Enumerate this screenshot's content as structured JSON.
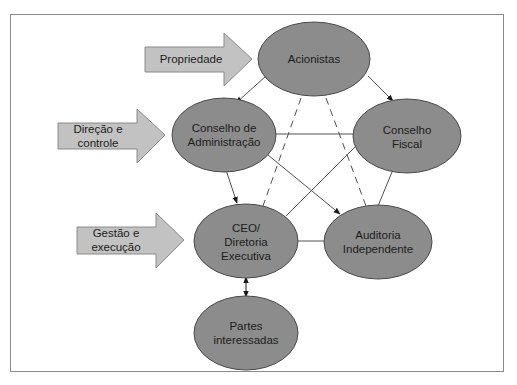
{
  "diagram": {
    "colors": {
      "node_fill": "#8c8c8c",
      "node_stroke": "#4a4a4a",
      "arrow_fill": "#c2c2c2",
      "arrow_stroke": "#8a8a8a",
      "line": "#505050",
      "frame": "#8a8a8a"
    },
    "nodes": {
      "acionistas": {
        "lines": [
          "Acionistas"
        ]
      },
      "conselho_admin": {
        "lines": [
          "Conselho de",
          "Administração"
        ]
      },
      "conselho_fiscal": {
        "lines": [
          "Conselho",
          "Fiscal"
        ]
      },
      "ceo": {
        "lines": [
          "CEO/",
          "Diretoria",
          "Executiva"
        ]
      },
      "auditoria": {
        "lines": [
          "Auditoria",
          "Independente"
        ]
      },
      "partes": {
        "lines": [
          "Partes",
          "interessadas"
        ]
      }
    },
    "side_arrows": {
      "propriedade": {
        "lines": [
          "Propriedade"
        ]
      },
      "direcao": {
        "lines": [
          "Direção e",
          "controle"
        ]
      },
      "gestao": {
        "lines": [
          "Gestão e",
          "execução"
        ]
      }
    },
    "connections": [
      {
        "from": "Acionistas",
        "to": "Conselho de Administração",
        "style": "solid-arrow"
      },
      {
        "from": "Acionistas",
        "to": "Conselho Fiscal",
        "style": "solid-arrow"
      },
      {
        "from": "Acionistas",
        "to": "CEO/Diretoria Executiva",
        "style": "dashed"
      },
      {
        "from": "Acionistas",
        "to": "Auditoria Independente",
        "style": "dashed"
      },
      {
        "from": "Conselho de Administração",
        "to": "Conselho Fiscal",
        "style": "solid"
      },
      {
        "from": "Conselho de Administração",
        "to": "CEO/Diretoria Executiva",
        "style": "solid-arrow"
      },
      {
        "from": "Conselho de Administração",
        "to": "Auditoria Independente",
        "style": "solid-arrow"
      },
      {
        "from": "Conselho Fiscal",
        "to": "CEO/Diretoria Executiva",
        "style": "solid"
      },
      {
        "from": "Conselho Fiscal",
        "to": "Auditoria Independente",
        "style": "solid"
      },
      {
        "from": "CEO/Diretoria Executiva",
        "to": "Auditoria Independente",
        "style": "solid"
      },
      {
        "from": "CEO/Diretoria Executiva",
        "to": "Partes interessadas",
        "style": "double-arrow"
      }
    ]
  }
}
